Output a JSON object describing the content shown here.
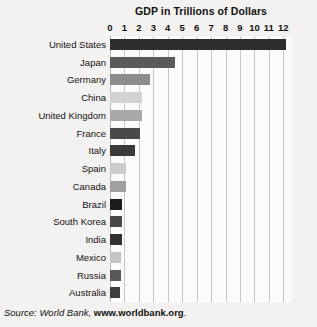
{
  "chart_data": {
    "type": "bar",
    "orientation": "horizontal",
    "title": "GDP in Trillions of Dollars",
    "xlabel": "",
    "ylabel": "",
    "xlim": [
      0,
      12.6
    ],
    "grid": true,
    "legend": null,
    "xticks": [
      "0",
      "1",
      "2",
      "3",
      "4",
      "5",
      "6",
      "7",
      "8",
      "9",
      "10",
      "11",
      "12"
    ],
    "xtick_values": [
      0,
      1,
      2,
      3,
      4,
      5,
      6,
      7,
      8,
      9,
      10,
      11,
      12
    ],
    "categories": [
      "United States",
      "Japan",
      "Germany",
      "China",
      "United Kingdom",
      "France",
      "Italy",
      "Spain",
      "Canada",
      "Brazil",
      "South Korea",
      "India",
      "Mexico",
      "Russia",
      "Australia"
    ],
    "values": [
      12.2,
      4.5,
      2.8,
      2.2,
      2.2,
      2.1,
      1.7,
      1.1,
      1.1,
      0.8,
      0.8,
      0.8,
      0.77,
      0.75,
      0.7
    ],
    "bar_colors": [
      "#2e2e2e",
      "#5a5a5a",
      "#8c8c8c",
      "#d2d2d2",
      "#a8a8a8",
      "#4a4a4a",
      "#3a3a3a",
      "#cccccc",
      "#a0a0a0",
      "#1c1c1c",
      "#484848",
      "#303030",
      "#c4c4c4",
      "#585858",
      "#3c3c3c"
    ]
  },
  "source": {
    "prefix": "Source: World Bank, ",
    "url": "www.worldbank.org",
    "period": "."
  },
  "colors": {
    "background": "#f4f2f0",
    "plot_background": "#fcfbfa",
    "gridline": "#c9c6c3",
    "text": "#111111"
  }
}
